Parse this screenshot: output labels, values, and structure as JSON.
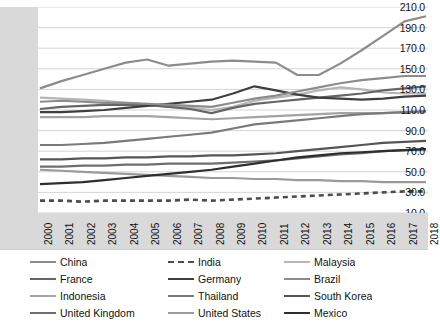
{
  "chart_data": {
    "type": "line",
    "title": "",
    "xlabel": "",
    "ylabel": "",
    "x": [
      2000,
      2001,
      2002,
      2003,
      2004,
      2005,
      2006,
      2007,
      2008,
      2009,
      2010,
      2011,
      2012,
      2013,
      2014,
      2015,
      2016,
      2017,
      2018
    ],
    "xlim": [
      2000,
      2018
    ],
    "ylim": [
      10.0,
      210.0
    ],
    "yticks": [
      "210.0",
      "190.0",
      "170.0",
      "150.0",
      "130.0",
      "110.0",
      "90.0",
      "70.0",
      "50.0",
      "30.0",
      "10.0"
    ],
    "ytick_values": [
      210.0,
      190.0,
      170.0,
      150.0,
      130.0,
      110.0,
      90.0,
      70.0,
      50.0,
      30.0,
      10.0
    ],
    "grid": true,
    "legend_position": "bottom",
    "legend_columns": 3,
    "series": [
      {
        "name": "China",
        "color": "#8c8c8c",
        "dash": false,
        "values": [
          131,
          138,
          144,
          150,
          156,
          159,
          153,
          155,
          157,
          158,
          157,
          156,
          144,
          144,
          155,
          168,
          182,
          196,
          201
        ]
      },
      {
        "name": "India",
        "color": "#4d4d4d",
        "dash": true,
        "values": [
          22,
          22,
          21,
          22,
          22,
          22,
          22,
          23,
          22,
          23,
          24,
          25,
          26,
          27,
          28,
          29,
          30,
          31,
          31
        ]
      },
      {
        "name": "Malaysia",
        "color": "#b5b5b5",
        "dash": false,
        "values": [
          122,
          121,
          120,
          119,
          117,
          115,
          113,
          112,
          110,
          113,
          119,
          122,
          125,
          129,
          132,
          130,
          127,
          126,
          126
        ]
      },
      {
        "name": "France",
        "color": "#666666",
        "dash": false,
        "values": [
          111,
          113,
          114,
          115,
          115,
          115,
          113,
          111,
          107,
          112,
          116,
          118,
          120,
          122,
          124,
          126,
          129,
          131,
          133
        ]
      },
      {
        "name": "Germany",
        "color": "#3f3f3f",
        "dash": false,
        "values": [
          108,
          108,
          109,
          110,
          112,
          114,
          116,
          118,
          120,
          126,
          133,
          129,
          125,
          122,
          121,
          120,
          121,
          123,
          124
        ]
      },
      {
        "name": "Brazil",
        "color": "#8c8c8c",
        "dash": false,
        "values": [
          118,
          119,
          118,
          117,
          117,
          116,
          115,
          114,
          113,
          117,
          121,
          124,
          128,
          132,
          136,
          139,
          141,
          143,
          143
        ]
      },
      {
        "name": "Indonesia",
        "color": "#a3a3a3",
        "dash": false,
        "values": [
          103,
          103,
          103,
          104,
          104,
          104,
          103,
          102,
          101,
          102,
          103,
          104,
          105,
          106,
          107,
          107,
          107,
          108,
          108
        ]
      },
      {
        "name": "Thailand",
        "color": "#7a7a7a",
        "dash": false,
        "values": [
          76,
          76,
          77,
          78,
          80,
          82,
          84,
          86,
          88,
          92,
          96,
          98,
          100,
          102,
          104,
          106,
          107,
          108,
          109
        ]
      },
      {
        "name": "South Korea",
        "color": "#555555",
        "dash": false,
        "values": [
          62,
          62,
          63,
          63,
          64,
          64,
          65,
          65,
          66,
          66,
          67,
          68,
          70,
          72,
          74,
          76,
          78,
          79,
          80
        ]
      },
      {
        "name": "United Kingdom",
        "color": "#6e6e6e",
        "dash": false,
        "values": [
          55,
          55,
          56,
          56,
          57,
          57,
          58,
          58,
          58,
          59,
          60,
          61,
          63,
          65,
          67,
          68,
          70,
          71,
          72
        ]
      },
      {
        "name": "United States",
        "color": "#9a9a9a",
        "dash": false,
        "values": [
          52,
          51,
          50,
          49,
          48,
          47,
          46,
          45,
          44,
          44,
          43,
          43,
          42,
          42,
          41,
          41,
          40,
          40,
          40
        ]
      },
      {
        "name": "Mexico",
        "color": "#2e2e2e",
        "dash": false,
        "values": [
          38,
          39,
          40,
          42,
          44,
          46,
          48,
          50,
          52,
          55,
          58,
          61,
          64,
          66,
          68,
          69,
          70,
          71,
          72
        ]
      }
    ]
  },
  "axes": {
    "y_labels": [
      "210.0",
      "190.0",
      "170.0",
      "150.0",
      "130.0",
      "110.0",
      "90.0",
      "70.0",
      "50.0",
      "30.0",
      "10.0"
    ],
    "x_labels": [
      "2000",
      "2001",
      "2002",
      "2003",
      "2004",
      "2005",
      "2006",
      "2007",
      "2008",
      "2009",
      "2010",
      "2011",
      "2012",
      "2013",
      "2014",
      "2015",
      "2016",
      "2017",
      "2018"
    ]
  },
  "legend": {
    "entries": [
      {
        "label": "China"
      },
      {
        "label": "India"
      },
      {
        "label": "Malaysia"
      },
      {
        "label": "France"
      },
      {
        "label": "Germany"
      },
      {
        "label": "Brazil"
      },
      {
        "label": "Indonesia"
      },
      {
        "label": "Thailand"
      },
      {
        "label": "South Korea"
      },
      {
        "label": "United Kingdom"
      },
      {
        "label": "United States"
      },
      {
        "label": "Mexico"
      }
    ]
  },
  "colors": {
    "y_axis_band": "#d9d9d9",
    "x_axis_band": "#d9d9d9",
    "plot_background": "#ffffff",
    "gridline": "#d0d0d0"
  }
}
